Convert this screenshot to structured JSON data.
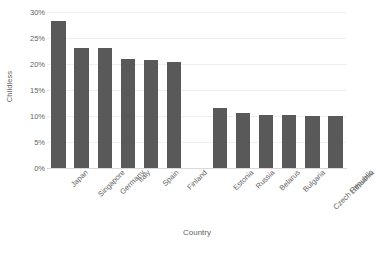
{
  "chart_data": {
    "type": "bar",
    "title": "",
    "xlabel": "Country",
    "ylabel": "Childless",
    "ylim": [
      0,
      30
    ],
    "ytick_values": [
      0,
      5,
      10,
      15,
      20,
      25,
      30
    ],
    "ytick_labels": [
      "0%",
      "5%",
      "10%",
      "15%",
      "20%",
      "25%",
      "30%"
    ],
    "grid": true,
    "legend": "none",
    "bar_color": "#595959",
    "gridline_color": "#efefef",
    "axis_color": "#d9d9d9",
    "text_color": "#636363",
    "group_gap_after_index": 5,
    "categories": [
      "Japan",
      "Singapore",
      "Germany",
      "Italy",
      "Spain",
      "Finland",
      "Estonia",
      "Russia",
      "Belarus",
      "Bulgaria",
      "Czech Republic",
      "Lithuania"
    ],
    "values": [
      28.2,
      23.1,
      23.0,
      20.9,
      20.7,
      20.4,
      11.5,
      10.5,
      10.2,
      10.1,
      10.0,
      10.0
    ]
  }
}
